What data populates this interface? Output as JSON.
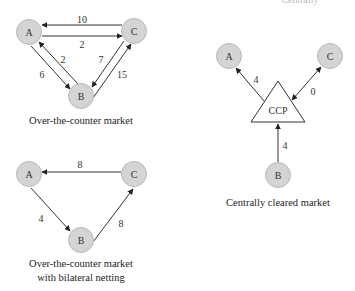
{
  "header_fragment": "Centrally",
  "diagrams": {
    "otc": {
      "caption": "Over-the-counter market",
      "nodes": {
        "A": "A",
        "B": "B",
        "C": "C"
      },
      "edges": [
        {
          "from": "C",
          "to": "A",
          "value": "10"
        },
        {
          "from": "A",
          "to": "C",
          "value": "2"
        },
        {
          "from": "B",
          "to": "A",
          "value": "2"
        },
        {
          "from": "A",
          "to": "B",
          "value": "6"
        },
        {
          "from": "C",
          "to": "B",
          "value": "7"
        },
        {
          "from": "B",
          "to": "C",
          "value": "15"
        }
      ]
    },
    "otc_netting": {
      "caption_line1": "Over-the-counter market",
      "caption_line2": "with bilateral netting",
      "nodes": {
        "A": "A",
        "B": "B",
        "C": "C"
      },
      "edges": [
        {
          "from": "C",
          "to": "A",
          "value": "8"
        },
        {
          "from": "A",
          "to": "B",
          "value": "4"
        },
        {
          "from": "B",
          "to": "C",
          "value": "8"
        }
      ]
    },
    "ccp": {
      "caption": "Centrally cleared market",
      "hub": "CCP",
      "nodes": {
        "A": "A",
        "B": "B",
        "C": "C"
      },
      "edges": [
        {
          "from": "CCP",
          "to": "A",
          "value": "4"
        },
        {
          "from": "C",
          "to": "CCP",
          "value": "0"
        },
        {
          "from": "B",
          "to": "CCP",
          "value": "4"
        }
      ]
    }
  }
}
